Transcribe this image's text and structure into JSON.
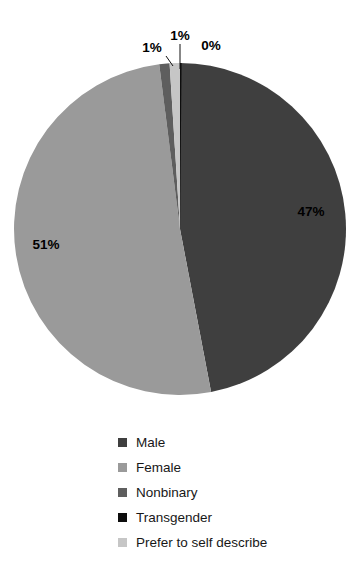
{
  "chart_data": {
    "type": "pie",
    "title": "",
    "subtitle": "",
    "xlabel": "",
    "ylabel": "",
    "legend_position": "bottom-left",
    "grid": false,
    "categories": [
      "Male",
      "Female",
      "Nonbinary",
      "Transgender",
      "Prefer to self describe"
    ],
    "values": [
      47,
      51,
      1,
      0,
      1
    ],
    "value_labels": [
      "47%",
      "51%",
      "1%",
      "0%",
      "1%"
    ],
    "colors": [
      "#3f3f3f",
      "#9a9a9a",
      "#5e5e5e",
      "#0d0d0d",
      "#c6c6c6"
    ],
    "slices": [
      {
        "name": "Male",
        "value": 47,
        "label": "47%",
        "color": "#3f3f3f",
        "label_placement": "inside"
      },
      {
        "name": "Female",
        "value": 51,
        "label": "51%",
        "color": "#9a9a9a",
        "label_placement": "inside"
      },
      {
        "name": "Nonbinary",
        "value": 1,
        "label": "1%",
        "color": "#5e5e5e",
        "label_placement": "callout"
      },
      {
        "name": "Transgender",
        "value": 0,
        "label": "0%",
        "color": "#0d0d0d",
        "label_placement": "callout"
      },
      {
        "name": "Prefer to self describe",
        "value": 1,
        "label": "1%",
        "color": "#c6c6c6",
        "label_placement": "callout"
      }
    ]
  },
  "labels": {
    "male_pct": "47%",
    "female_pct": "51%",
    "callout_left_pct": "1%",
    "callout_mid_pct": "1%",
    "callout_right_pct": "0%"
  },
  "legend": {
    "items": [
      {
        "label": "Male",
        "color": "#3f3f3f"
      },
      {
        "label": "Female",
        "color": "#9a9a9a"
      },
      {
        "label": "Nonbinary",
        "color": "#5e5e5e"
      },
      {
        "label": "Transgender",
        "color": "#0d0d0d"
      },
      {
        "label": "Prefer to self describe",
        "color": "#c6c6c6"
      }
    ]
  }
}
